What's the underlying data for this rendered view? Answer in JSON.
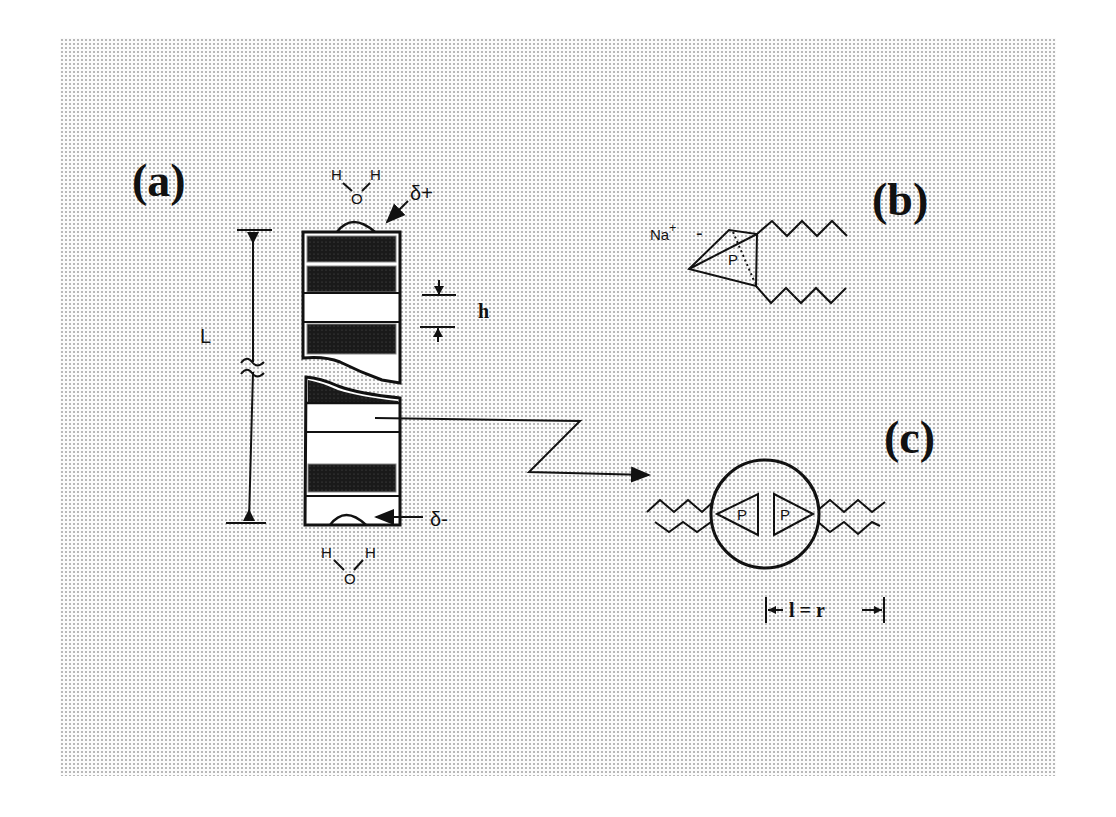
{
  "figure": {
    "panels": {
      "a": {
        "label": "(a)",
        "top_water": {
          "h_left": "H",
          "h_right": "H",
          "o": "O"
        },
        "top_charge": "δ+",
        "bottom_charge": "δ-",
        "bottom_water": {
          "h_left": "H",
          "h_right": "H",
          "o": "O"
        },
        "length_label": "L",
        "band_height_label": "h"
      },
      "b": {
        "label": "(b)",
        "counterion": "Na",
        "counterion_charge": "+",
        "head_charge": "-",
        "phosphorus": "P"
      },
      "c": {
        "label": "(c)",
        "phosphorus_left": "P",
        "phosphorus_right": "P",
        "dimension_label": "l = r"
      }
    },
    "colors": {
      "ink": "#111111",
      "band_dark": "#1a1a1a",
      "background_dots": "#b8b8b8"
    }
  }
}
